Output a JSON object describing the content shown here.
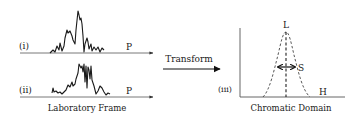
{
  "panels": {
    "lab": {
      "signal_i_label": "(i)",
      "signal_ii_label": "(ii)",
      "axis_label_i": "P",
      "axis_label_ii": "P",
      "caption": "Laboratory Frame"
    },
    "transform": {
      "label": "Transform"
    },
    "chromatic": {
      "panel_label": "(iii)",
      "peak_label": "L",
      "spread_label": "S",
      "axis_label": "H",
      "caption": "Chromatic Domain"
    }
  },
  "colors": {
    "line": "#1a1a1a",
    "axis": "#555555",
    "dashed": "#444444"
  }
}
